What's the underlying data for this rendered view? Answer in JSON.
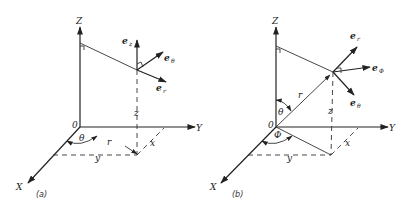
{
  "panels": [
    {
      "caption": "(a)",
      "axes": {
        "x": "X",
        "y": "Y",
        "z": "Z",
        "origin": "0"
      },
      "coords": {
        "x": "x",
        "y": "y",
        "z": "z",
        "r": "r",
        "angle": "θ"
      },
      "vectors": [
        {
          "base": "e",
          "sub": "z"
        },
        {
          "base": "e",
          "sub": "θ"
        },
        {
          "base": "e",
          "sub": "r"
        }
      ]
    },
    {
      "caption": "(b)",
      "axes": {
        "x": "X",
        "y": "Y",
        "z": "Z",
        "origin": "0"
      },
      "coords": {
        "x": "x",
        "y": "y",
        "z": "z",
        "r": "r",
        "polar": "θ",
        "azimuth": "Φ"
      },
      "vectors": [
        {
          "base": "e",
          "sub": "r"
        },
        {
          "base": "e",
          "sub": "Φ"
        },
        {
          "base": "e",
          "sub": "θ"
        }
      ]
    }
  ]
}
